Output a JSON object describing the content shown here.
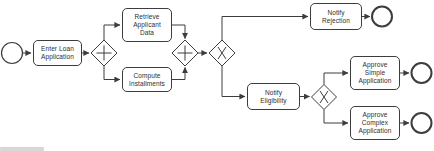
{
  "diagram": {
    "type": "bpmn-process",
    "colors": {
      "stroke": "#3d3d3d",
      "node_fill": "#ffffff",
      "text": "#2e2e2e",
      "background": "#ffffff"
    },
    "events": {
      "start_count": 1,
      "end_count": 3
    },
    "tasks": {
      "enter_loan": {
        "label": "Enter Loan\nApplication"
      },
      "retrieve": {
        "label": "Retrieve\nApplicant\nData"
      },
      "compute": {
        "label": "Compute\nInstallments"
      },
      "notify_rejection": {
        "label": "Notify\nRejection"
      },
      "notify_eligibility": {
        "label": "Notify\nEligibility"
      },
      "approve_simple": {
        "label": "Approve\nSimple\nApplication"
      },
      "approve_complex": {
        "label": "Approve\nComplex\nApplication"
      }
    },
    "gateways": {
      "parallel_split": {
        "type": "parallel",
        "symbol": "+"
      },
      "parallel_join": {
        "type": "parallel",
        "symbol": "+"
      },
      "exclusive_split_1": {
        "type": "exclusive",
        "symbol": "X"
      },
      "exclusive_split_2": {
        "type": "exclusive",
        "symbol": "X"
      }
    },
    "flows": [
      "start-event -> enter_loan",
      "enter_loan -> parallel_split",
      "parallel_split -> retrieve",
      "parallel_split -> compute",
      "retrieve -> parallel_join",
      "compute -> parallel_join",
      "parallel_join -> exclusive_split_1",
      "exclusive_split_1 -> notify_rejection",
      "notify_rejection -> end-event-1",
      "exclusive_split_1 -> notify_eligibility",
      "notify_eligibility -> exclusive_split_2",
      "exclusive_split_2 -> approve_simple",
      "approve_simple -> end-event-2",
      "exclusive_split_2 -> approve_complex",
      "approve_complex -> end-event-3"
    ]
  }
}
